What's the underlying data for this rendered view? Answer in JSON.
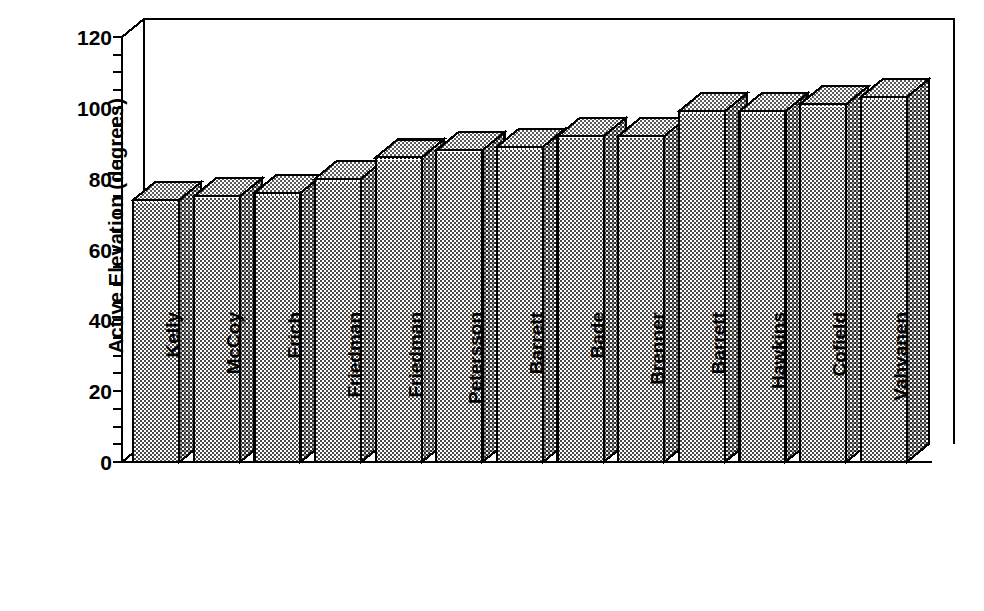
{
  "chart": {
    "type": "bar",
    "title": "",
    "xlabel": "",
    "ylabel": "Active Elevation (degrees)",
    "style": "3d-bar",
    "ylim": [
      0,
      120
    ],
    "ytick_step": 20,
    "yminor_step": 5,
    "grid": false,
    "legend": "none",
    "bar_color": "#9a9a9a",
    "bar_edge_color": "#000000",
    "background": "#ffffff"
  },
  "chart_data": {
    "type": "bar",
    "title": "",
    "xlabel": "",
    "ylabel": "Active Elevation (degrees)",
    "ylim": [
      0,
      120
    ],
    "yticks": [
      0,
      20,
      40,
      60,
      80,
      100,
      120
    ],
    "ytick_labels": [
      "0",
      "20",
      "40",
      "60",
      "80",
      "100",
      "120"
    ],
    "grid": false,
    "legend_position": "none",
    "categories": [
      "Kelly",
      "McCoy",
      "Frich",
      "Friedman",
      "Friedman",
      "Petersson",
      "Barrett",
      "Bade",
      "Brenner",
      "Barrett",
      "Hawkins",
      "Cofield",
      "Vahvanen"
    ],
    "values": [
      74,
      75,
      76,
      80,
      86,
      88,
      89,
      92,
      92,
      99,
      99,
      101,
      103
    ],
    "shades": [
      "#a0a0a0",
      "#a0a0a0",
      "#8a8a8a",
      "#9c9c9c",
      "#b4b4b4",
      "#b8b8b8",
      "#a8a8a8",
      "#a4a4a4",
      "#9c9c9c",
      "#9c9c9c",
      "#a0a0a0",
      "#b0b0b0",
      "#a8a8a8"
    ]
  }
}
